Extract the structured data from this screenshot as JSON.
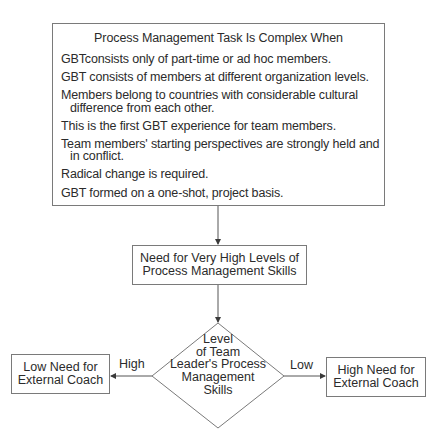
{
  "top_box": {
    "title": "Process Management Task Is Complex When",
    "conditions": [
      "GBTconsists only of part-time or ad hoc members.",
      "GBT consists of members at different organization levels.",
      "Members belong to countries with considerable cultural difference from each other.",
      "This is the first GBT experience for team members.",
      "Team members' starting perspectives are strongly held and in conflict.",
      "Radical change is required.",
      "GBT formed on a one-shot, project basis."
    ]
  },
  "middle_box": {
    "lines": [
      "Need for Very High Levels of",
      "Process Management Skills"
    ]
  },
  "decision": {
    "lines": [
      "Level",
      "of Team",
      "Leader's Process",
      "Management",
      "Skills"
    ]
  },
  "branches": {
    "high_label": "High",
    "low_label": "Low"
  },
  "left_box": {
    "lines": [
      "Low Need for",
      "External Coach"
    ]
  },
  "right_box": {
    "lines": [
      "High Need for",
      "External Coach"
    ]
  },
  "colors": {
    "stroke": "#7a7a7a",
    "text": "#2b2b2b",
    "background": "#ffffff"
  }
}
